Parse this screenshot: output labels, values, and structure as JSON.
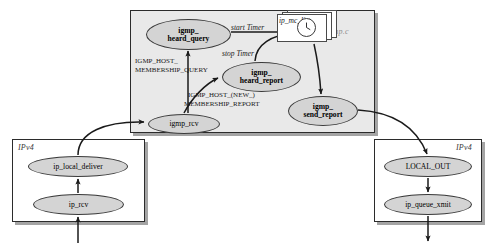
{
  "diagram": {
    "modules": {
      "igmp": {
        "label": "igmp.c",
        "x": 130,
        "y": 10,
        "w": 245,
        "h": 123
      },
      "ipv4_left": {
        "label": "IPv4",
        "x": 12,
        "y": 139,
        "w": 133,
        "h": 83
      },
      "ipv4_right": {
        "label": "IPv4",
        "x": 374,
        "y": 139,
        "w": 108,
        "h": 83
      }
    },
    "nodes": [
      {
        "id": "igmp_heard_query",
        "line1": "igmp_",
        "line2": "heard_query",
        "bold": true,
        "x": 146,
        "y": 19,
        "w": 85,
        "h": 31
      },
      {
        "id": "igmp_heard_report",
        "line1": "igmp_",
        "line2": "heard_report",
        "bold": true,
        "x": 222,
        "y": 62,
        "w": 79,
        "h": 30
      },
      {
        "id": "igmp_send_report",
        "line1": "igmp_",
        "line2": "send_report",
        "bold": true,
        "x": 288,
        "y": 96,
        "w": 70,
        "h": 30
      },
      {
        "id": "igmp_rcv",
        "line1": "igmp_rcv",
        "line2": "",
        "bold": false,
        "x": 148,
        "y": 114,
        "w": 72,
        "h": 20
      },
      {
        "id": "ip_local_deliver",
        "line1": "ip_local_deliver",
        "line2": "",
        "bold": false,
        "x": 28,
        "y": 156,
        "w": 100,
        "h": 21
      },
      {
        "id": "ip_rcv",
        "line1": "ip_rcv",
        "line2": "",
        "bold": false,
        "x": 33,
        "y": 194,
        "w": 91,
        "h": 21
      },
      {
        "id": "LOCAL_OUT",
        "line1": "LOCAL_OUT",
        "line2": "",
        "bold": false,
        "x": 384,
        "y": 156,
        "w": 88,
        "h": 21
      },
      {
        "id": "ip_queue_xmit",
        "line1": "ip_queue_xmit",
        "line2": "",
        "bold": false,
        "x": 384,
        "y": 194,
        "w": 88,
        "h": 21
      }
    ],
    "data_store": {
      "id": "ip_mc_list",
      "label": "ip_mc_list",
      "icon": "clock-icon",
      "x": 277,
      "y": 14,
      "w": 50,
      "h": 28
    },
    "edge_labels": [
      {
        "id": "start_timer",
        "text": "start Timer",
        "italic": true,
        "x": 231,
        "y": 24,
        "size": 7.5,
        "align": "left"
      },
      {
        "id": "stop_timer",
        "text": "stop Timer",
        "italic": true,
        "x": 222,
        "y": 50,
        "size": 7.5,
        "align": "left"
      },
      {
        "id": "igmp_host_membership_query_l1",
        "text": "IGMP_HOST_",
        "italic": false,
        "x": 135,
        "y": 58,
        "size": 7,
        "align": "left"
      },
      {
        "id": "igmp_host_membership_query_l2",
        "text": "MEMBERSHIP_QUERY",
        "italic": false,
        "x": 135,
        "y": 67,
        "size": 7,
        "align": "left"
      },
      {
        "id": "igmp_host_new_membership_report_l1",
        "text": "IGMP_HOST_(NEW_)",
        "italic": false,
        "x": 188,
        "y": 92,
        "size": 7,
        "align": "left"
      },
      {
        "id": "igmp_host_new_membership_report_l2",
        "text": "MEMBERSHIP_REPORT",
        "italic": false,
        "x": 184,
        "y": 101,
        "size": 7,
        "align": "left"
      }
    ],
    "colors": {
      "node_fill": "#d4d4d4",
      "module_fill": "#e9e9e9",
      "stroke": "#2b2b2b",
      "module_label": "#8d8d8d",
      "sheet_fill": "#ffffff"
    }
  }
}
